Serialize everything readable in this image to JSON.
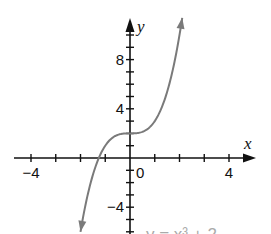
{
  "chart_data": {
    "type": "line",
    "title": "",
    "equation_label": "y = x³ + 2",
    "xlabel": "x",
    "ylabel": "y",
    "xlim": [
      -4.7,
      5
    ],
    "ylim": [
      -6,
      11.5
    ],
    "x_tick_step": 1,
    "y_tick_step": 1,
    "x_tick_labels": [
      {
        "value": -4,
        "label": "−4"
      },
      {
        "value": 0,
        "label": "0"
      },
      {
        "value": 4,
        "label": "4"
      }
    ],
    "y_tick_labels": [
      {
        "value": 8,
        "label": "8"
      },
      {
        "value": 4,
        "label": "4"
      },
      {
        "value": -4,
        "label": "−4"
      }
    ],
    "grid": false,
    "series": [
      {
        "name": "y = x^3 + 2",
        "function": "x^3 + 2",
        "x_range": [
          -2.0,
          2.11
        ],
        "x": [
          -2,
          -1.5,
          -1,
          -0.5,
          0,
          0.5,
          1,
          1.5,
          2
        ],
        "y": [
          -6,
          -1.375,
          1,
          1.875,
          2,
          2.125,
          3,
          5.375,
          10
        ],
        "color": "#7a7a7a",
        "arrows_at_ends": true
      }
    ],
    "colors": {
      "axis": "#111111",
      "curve": "#7a7a7a"
    }
  }
}
